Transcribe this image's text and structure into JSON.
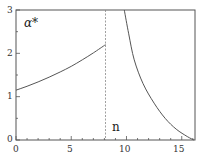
{
  "chart_data": {
    "type": "line",
    "title": "",
    "xlabel": "n",
    "ylabel": "α*",
    "xlim": [
      0,
      16.2
    ],
    "ylim": [
      0,
      3
    ],
    "grid": false,
    "legend": null,
    "x_ticks": [
      0,
      5,
      10,
      15
    ],
    "y_ticks": [
      0,
      1,
      2,
      3
    ],
    "series": [
      {
        "name": "left branch",
        "style": "solid",
        "x": [
          0,
          1,
          2,
          3,
          4,
          5,
          6,
          7,
          8.1
        ],
        "y": [
          1.15,
          1.24,
          1.34,
          1.45,
          1.57,
          1.7,
          1.85,
          2.01,
          2.2
        ]
      },
      {
        "name": "right branch",
        "style": "solid",
        "x": [
          9.8,
          10.2,
          10.7,
          11.5,
          12.5,
          13.5,
          14.5,
          15.5,
          16.1
        ],
        "y": [
          3.0,
          2.45,
          1.85,
          1.3,
          0.85,
          0.5,
          0.25,
          0.08,
          0.0
        ]
      }
    ],
    "annotations": [
      {
        "type": "vline",
        "x": 8.1,
        "style": "dashed"
      },
      {
        "type": "text",
        "text": "α*",
        "position": "top-left"
      },
      {
        "type": "text",
        "text": "n",
        "position": "near x-axis, right of dashed line"
      }
    ]
  },
  "labels": {
    "x_ticks": [
      "0",
      "5",
      "10",
      "15"
    ],
    "y_ticks": [
      "0",
      "1",
      "2",
      "3"
    ],
    "ylabel": "α*",
    "xlabel": "n"
  },
  "colors": {
    "axis": "#555555",
    "curve": "#555555",
    "dashed": "#888888"
  }
}
